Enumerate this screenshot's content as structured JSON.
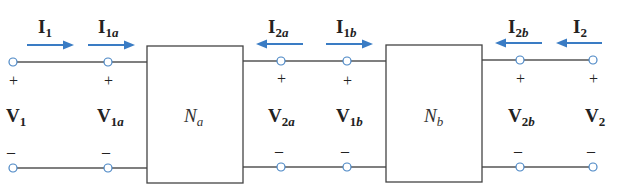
{
  "diagram": {
    "colors": {
      "arrow": "#3a7cc4",
      "terminal": "#4a86c5",
      "wire": "#555555",
      "text": "#222222"
    },
    "networks": [
      {
        "main": "N",
        "sub": "a"
      },
      {
        "main": "N",
        "sub": "b"
      }
    ],
    "currents": [
      {
        "main": "I",
        "sub": "1",
        "direction": "right"
      },
      {
        "main": "I",
        "sub": "1a",
        "direction": "right"
      },
      {
        "main": "I",
        "sub": "2a",
        "direction": "left"
      },
      {
        "main": "I",
        "sub": "1b",
        "direction": "right"
      },
      {
        "main": "I",
        "sub": "2b",
        "direction": "left"
      },
      {
        "main": "I",
        "sub": "2",
        "direction": "left"
      }
    ],
    "voltages": [
      {
        "main": "V",
        "sub": "1"
      },
      {
        "main": "V",
        "sub": "1a"
      },
      {
        "main": "V",
        "sub": "2a"
      },
      {
        "main": "V",
        "sub": "1b"
      },
      {
        "main": "V",
        "sub": "2b"
      },
      {
        "main": "V",
        "sub": "2"
      }
    ],
    "polarity": {
      "plus": "+",
      "minus": "–"
    }
  }
}
